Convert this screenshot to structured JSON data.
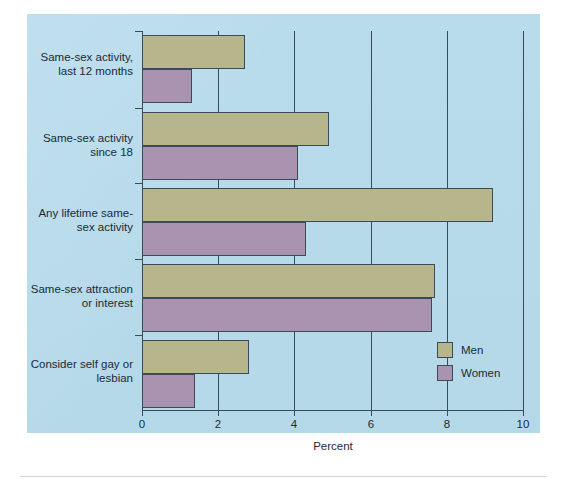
{
  "panel": {
    "background_color": "#b9dcec",
    "page_background_color": "#ffffff"
  },
  "colors": {
    "men": "#b6b58b",
    "women": "#aa93b1",
    "axis": "#3c4a55",
    "text": "#1b2a36"
  },
  "axis": {
    "x_label": "Percent",
    "x_ticks": [
      "0",
      "2",
      "4",
      "6",
      "8",
      "10"
    ]
  },
  "legend": {
    "entries": [
      {
        "label": "Men",
        "swatch": "men-swatch"
      },
      {
        "label": "Women",
        "swatch": "women-swatch"
      }
    ]
  },
  "categories": [
    {
      "line1": "Same-sex activity,",
      "line2": "last 12 months"
    },
    {
      "line1": "Same-sex activity",
      "line2": "since 18"
    },
    {
      "line1": "Any lifetime same-",
      "line2": "sex activity"
    },
    {
      "line1": "Same-sex attraction",
      "line2": "or interest"
    },
    {
      "line1": "Consider self gay or",
      "line2": "lesbian"
    }
  ],
  "chart_data": {
    "type": "bar",
    "orientation": "horizontal",
    "title": "",
    "xlabel": "Percent",
    "ylabel": "",
    "xlim": [
      0,
      10
    ],
    "xticks": [
      0,
      2,
      4,
      6,
      8,
      10
    ],
    "grid": "vertical",
    "legend_position": "lower-right-inside",
    "categories": [
      "Same-sex activity, last 12 months",
      "Same-sex activity since 18",
      "Any lifetime same-sex activity",
      "Same-sex attraction or interest",
      "Consider self gay or lesbian"
    ],
    "series": [
      {
        "name": "Men",
        "color": "#b6b58b",
        "values": [
          2.7,
          4.9,
          9.2,
          7.7,
          2.8
        ]
      },
      {
        "name": "Women",
        "color": "#aa93b1",
        "values": [
          1.3,
          4.1,
          4.3,
          7.6,
          1.4
        ]
      }
    ]
  }
}
